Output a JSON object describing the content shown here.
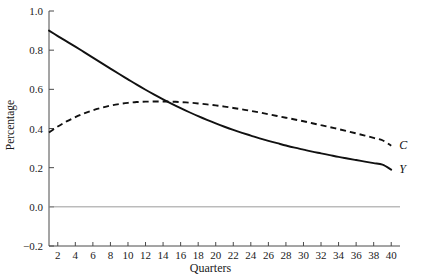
{
  "chart_data": {
    "type": "line",
    "title": "",
    "xlabel": "Quarters",
    "ylabel": "Percentage",
    "xlim": [
      1,
      41
    ],
    "ylim": [
      -0.2,
      1.0
    ],
    "grid": false,
    "legend_position": "right-of-line-ends",
    "xticks": [
      2,
      4,
      6,
      8,
      10,
      12,
      14,
      16,
      18,
      20,
      22,
      24,
      26,
      28,
      30,
      32,
      34,
      36,
      38,
      40
    ],
    "xtick_labels": [
      "2",
      "4",
      "6",
      "8",
      "10",
      "12",
      "14",
      "16",
      "18",
      "20",
      "22",
      "24",
      "26",
      "28",
      "30",
      "32",
      "34",
      "36",
      "38",
      "40"
    ],
    "yticks": [
      -0.2,
      0.0,
      0.2,
      0.4,
      0.6,
      0.8,
      1.0
    ],
    "ytick_labels": [
      "-0.2",
      "0.0",
      "0.2",
      "0.4",
      "0.6",
      "0.8",
      "1.0"
    ],
    "zero_line": 0.0,
    "x": [
      1,
      2,
      3,
      4,
      5,
      6,
      7,
      8,
      9,
      10,
      11,
      12,
      13,
      14,
      15,
      16,
      17,
      18,
      19,
      20,
      21,
      22,
      23,
      24,
      25,
      26,
      27,
      28,
      29,
      30,
      31,
      32,
      33,
      34,
      35,
      36,
      37,
      38,
      39,
      40
    ],
    "series": [
      {
        "name": "Y",
        "label": "Y",
        "style": "solid",
        "color": "#111111",
        "values": [
          0.9,
          0.872,
          0.845,
          0.818,
          0.79,
          0.762,
          0.734,
          0.706,
          0.678,
          0.651,
          0.624,
          0.598,
          0.573,
          0.549,
          0.526,
          0.504,
          0.483,
          0.463,
          0.444,
          0.426,
          0.409,
          0.393,
          0.378,
          0.364,
          0.35,
          0.337,
          0.325,
          0.313,
          0.302,
          0.292,
          0.282,
          0.273,
          0.264,
          0.255,
          0.247,
          0.239,
          0.231,
          0.223,
          0.215,
          0.19
        ]
      },
      {
        "name": "C",
        "label": "C",
        "style": "dashed",
        "color": "#111111",
        "values": [
          0.38,
          0.41,
          0.436,
          0.458,
          0.477,
          0.493,
          0.506,
          0.517,
          0.525,
          0.531,
          0.535,
          0.537,
          0.538,
          0.538,
          0.537,
          0.535,
          0.532,
          0.528,
          0.523,
          0.518,
          0.512,
          0.505,
          0.498,
          0.49,
          0.482,
          0.473,
          0.464,
          0.455,
          0.446,
          0.437,
          0.427,
          0.417,
          0.407,
          0.397,
          0.386,
          0.375,
          0.364,
          0.352,
          0.34,
          0.312
        ]
      }
    ],
    "annotations": [
      {
        "text": "C",
        "series": "C",
        "position": "end"
      },
      {
        "text": "Y",
        "series": "Y",
        "position": "end"
      }
    ],
    "colors": {
      "axis": "#4a4a4a",
      "zero_line": "#9a9a9a",
      "curve": "#111111",
      "background": "#ffffff",
      "text": "#1a1a1a"
    }
  }
}
